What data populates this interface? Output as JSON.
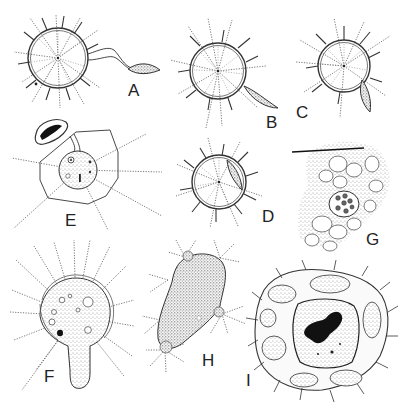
{
  "figure": {
    "type": "scientific-illustration-plate",
    "background": "#ffffff",
    "ink_color": "#333333",
    "panels": [
      {
        "id": "A",
        "label": "A",
        "subject": "radiating spherical cell with attached fusiform body on long filaments"
      },
      {
        "id": "B",
        "label": "B",
        "subject": "radiating spherical cell with fusiform body touching lower right"
      },
      {
        "id": "C",
        "label": "C",
        "subject": "radiating spherical cell with fusiform body penetrating wall"
      },
      {
        "id": "D",
        "label": "D",
        "subject": "radiating spherical cell with fusiform body inside wall"
      },
      {
        "id": "E",
        "label": "E",
        "subject": "stippled cell with nuclei attached to empty shell, within polygonal outline"
      },
      {
        "id": "F",
        "label": "F",
        "subject": "vacuolated stippled cell extruding tube through wall"
      },
      {
        "id": "G",
        "label": "G",
        "subject": "tissue of vacuolated cells containing cyst with nuclei, needle at top"
      },
      {
        "id": "H",
        "label": "H",
        "subject": "elongate stippled body with radiating bristle tufts"
      },
      {
        "id": "I",
        "label": "I",
        "subject": "multinucleate cell mass with large central nucleus and dark chromatin"
      }
    ]
  }
}
